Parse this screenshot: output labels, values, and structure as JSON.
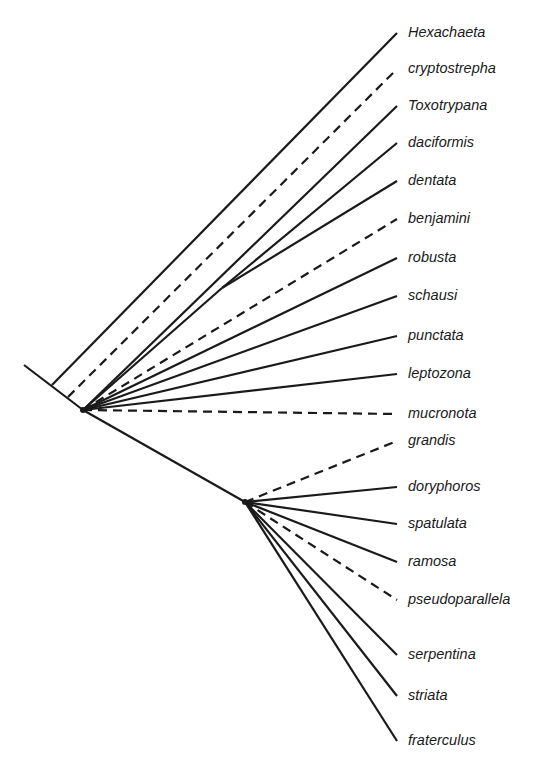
{
  "diagram": {
    "type": "phylogenetic-tree",
    "line_color": "#1a1a1a",
    "root": {
      "start": [
        24,
        365
      ],
      "node_a": [
        83,
        410
      ],
      "node_b": [
        245,
        502
      ]
    },
    "taxa": [
      {
        "name": "Hexachaeta",
        "y": 33,
        "from": [
          52,
          385
        ],
        "dashed": false
      },
      {
        "name": "cryptostrepha",
        "y": 69,
        "from": [
          68,
          397
        ],
        "dashed": true
      },
      {
        "name": "Toxotrypana",
        "y": 106,
        "from": [
          83,
          410
        ],
        "dashed": false
      },
      {
        "name": "daciformis",
        "y": 143,
        "from": [
          222,
          288
        ],
        "dashed": false
      },
      {
        "name": "dentata",
        "y": 181,
        "from": [
          222,
          288
        ],
        "dashed": false
      },
      {
        "name": "benjamini",
        "y": 219,
        "from": [
          83,
          410
        ],
        "dashed": true
      },
      {
        "name": "robusta",
        "y": 258,
        "from": [
          83,
          410
        ],
        "dashed": false
      },
      {
        "name": "schausi",
        "y": 296,
        "from": [
          83,
          410
        ],
        "dashed": false
      },
      {
        "name": "punctata",
        "y": 336,
        "from": [
          83,
          410
        ],
        "dashed": false
      },
      {
        "name": "leptozona",
        "y": 374,
        "from": [
          83,
          410
        ],
        "dashed": false
      },
      {
        "name": "mucronota",
        "y": 414,
        "from": [
          83,
          410
        ],
        "dashed": true
      },
      {
        "name": "grandis",
        "y": 441,
        "from": [
          245,
          502
        ],
        "dashed": true
      },
      {
        "name": "doryphoros",
        "y": 487,
        "from": [
          245,
          502
        ],
        "dashed": false
      },
      {
        "name": "spatulata",
        "y": 524,
        "from": [
          245,
          502
        ],
        "dashed": false
      },
      {
        "name": "ramosa",
        "y": 562,
        "from": [
          245,
          502
        ],
        "dashed": false
      },
      {
        "name": "pseudoparallela",
        "y": 600,
        "from": [
          245,
          502
        ],
        "dashed": true
      },
      {
        "name": "serpentina",
        "y": 655,
        "from": [
          245,
          502
        ],
        "dashed": false
      },
      {
        "name": "striata",
        "y": 696,
        "from": [
          245,
          502
        ],
        "dashed": false
      },
      {
        "name": "fraterculus",
        "y": 741,
        "from": [
          245,
          502
        ],
        "dashed": false
      }
    ],
    "internal_branches": [
      {
        "from": [
          83,
          410
        ],
        "to": [
          222,
          288
        ],
        "dashed": false
      }
    ],
    "tip_x": 397
  }
}
